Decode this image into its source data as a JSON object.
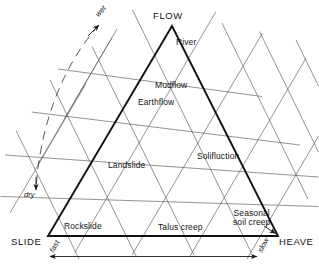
{
  "diagram": {
    "type": "ternary-classification-triangle",
    "title": "",
    "vertices": [
      {
        "id": "flow",
        "label": "FLOW",
        "position": "apex-top"
      },
      {
        "id": "slide",
        "label": "SLIDE",
        "position": "bottom-left"
      },
      {
        "id": "heave",
        "label": "HEAVE",
        "position": "bottom-right"
      }
    ],
    "fields": [
      {
        "id": "river",
        "label": "River"
      },
      {
        "id": "mudflow",
        "label": "Mudflow"
      },
      {
        "id": "earthflow",
        "label": "Earthflow"
      },
      {
        "id": "landslide",
        "label": "Landslide"
      },
      {
        "id": "solifluction",
        "label": "Solifluction"
      },
      {
        "id": "rockslide",
        "label": "Rockslide"
      },
      {
        "id": "talus-creep",
        "label": "Talus creep"
      },
      {
        "id": "seasonal-soil-creep",
        "label_line1": "Seasonal",
        "label_line2": "soil creep"
      }
    ],
    "axes": [
      {
        "id": "moisture",
        "high_label": "wet",
        "low_label": "dry",
        "orientation": "left-side-arc"
      },
      {
        "id": "rate",
        "high_label": "fast",
        "low_label": "slow",
        "orientation": "bottom-horizontal"
      }
    ],
    "grid": {
      "divisions": 4,
      "families": 3,
      "extends_outside_triangle": true
    },
    "colors": {
      "background": "#ffffff",
      "triangle_edge": "#111111",
      "grid_line": "#5a5a5a",
      "text": "#141414",
      "arrow": "#1a1a1a"
    }
  }
}
